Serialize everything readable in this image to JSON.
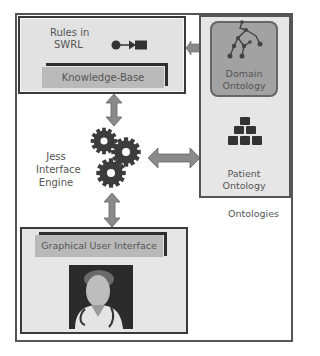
{
  "diagram": {
    "knowledge_box": {
      "rules_label_line1": "Rules in",
      "rules_label_line2": "SWRL",
      "kb_label": "Knowledge-Base",
      "icon": "rule-arrow-icon"
    },
    "engine": {
      "label_line1": "Jess",
      "label_line2": "Interface",
      "label_line3": "Engine",
      "icon": "gears-icon"
    },
    "ontologies": {
      "group_label": "Ontologies",
      "domain": {
        "label_line1": "Domain",
        "label_line2": "Ontology",
        "icon": "tree-graph-icon"
      },
      "patient": {
        "label_line1": "Patient",
        "label_line2": "Ontology",
        "icon": "folder-pyramid-icon"
      }
    },
    "gui_box": {
      "label": "Graphical User Interface",
      "icon": "doctor-avatar-icon"
    },
    "colors": {
      "frame": "#555555",
      "box_fill": "#e2e2e2",
      "bar_fill": "#b9b9b9",
      "domain_fill": "#a2a2a2",
      "arrow_fill": "#8a8a8a",
      "gear_fill": "#3c3c3c"
    }
  }
}
